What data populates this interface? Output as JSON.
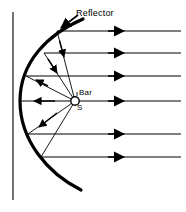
{
  "figure": {
    "type": "optics-ray-diagram",
    "width": 186,
    "height": 212,
    "background_color": "#ffffff",
    "stroke_color": "#000000"
  },
  "labels": {
    "reflector": "Reflector",
    "bar": "Bar",
    "source": "S"
  },
  "diagram_data": {
    "focus": {
      "x": 75,
      "y": 101,
      "radius": 4.5,
      "fill": "#ffffff",
      "stroke": "#000000"
    },
    "vertex": {
      "x": 20,
      "y": 101
    },
    "reflector_curve": {
      "description": "parabolic arc opening to the right, thick stroke",
      "stroke_width": 3.2,
      "top_end": {
        "x": 83,
        "y": 19
      },
      "bottom_end": {
        "x": 81,
        "y": 190
      },
      "path": "M 83 19 C 48 34 20 62 20 101 C 20 140 47 173 81 190"
    },
    "reference_line": {
      "description": "thin vertical directrix-like line at left",
      "x": 13,
      "y_top": 12,
      "y_bottom": 200,
      "stroke_width": 1.1
    },
    "outgoing_rays": [
      {
        "y": 31,
        "x_start": 57,
        "x_end": 181,
        "arrow_x": 122
      },
      {
        "y": 53,
        "x_start": 44,
        "x_end": 181,
        "arrow_x": 122
      },
      {
        "y": 76,
        "x_start": 26,
        "x_end": 181,
        "arrow_x": 122
      },
      {
        "y": 101,
        "x_start": 20,
        "x_end": 181,
        "arrow_x": 122
      },
      {
        "y": 134,
        "x_start": 28,
        "x_end": 181,
        "arrow_x": 122
      },
      {
        "y": 157,
        "x_start": 41,
        "x_end": 181,
        "arrow_x": 122
      }
    ],
    "source_rays": [
      {
        "from": {
          "x": 75,
          "y": 101
        },
        "to": {
          "x": 57,
          "y": 31
        },
        "arrow_at": 0.62
      },
      {
        "from": {
          "x": 75,
          "y": 101
        },
        "to": {
          "x": 44,
          "y": 53
        },
        "arrow_at": 0.62
      },
      {
        "from": {
          "x": 75,
          "y": 101
        },
        "to": {
          "x": 26,
          "y": 76
        },
        "arrow_at": 0.66
      },
      {
        "from": {
          "x": 75,
          "y": 101
        },
        "to": {
          "x": 20,
          "y": 101
        },
        "arrow_at": 0.62
      },
      {
        "from": {
          "x": 75,
          "y": 101
        },
        "to": {
          "x": 28,
          "y": 134
        },
        "arrow_at": 0.66
      },
      {
        "from": {
          "x": 75,
          "y": 101
        },
        "to": {
          "x": 41,
          "y": 157
        },
        "arrow_at": 1.0
      }
    ],
    "leader_line": {
      "description": "Reflector label leader arrow pointing down-left to the arc",
      "from": {
        "x": 78,
        "y": 15
      },
      "to": {
        "x": 61,
        "y": 28
      }
    }
  }
}
